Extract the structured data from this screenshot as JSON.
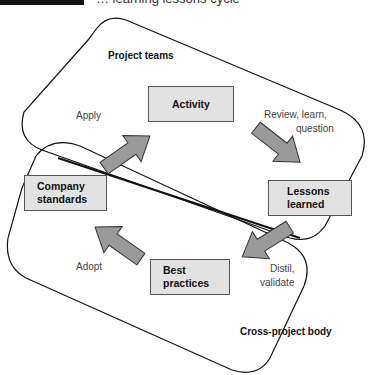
{
  "figure": {
    "caption_partial": "… learning lessons cycle"
  },
  "regions": {
    "top": {
      "title": "Project teams"
    },
    "bottom": {
      "title": "Cross-project body"
    }
  },
  "boxes": {
    "activity": {
      "label": "Activity"
    },
    "lessons": {
      "line1": "Lessons",
      "line2": "learned"
    },
    "best": {
      "line1": "Best",
      "line2": "practices"
    },
    "company": {
      "line1": "Company",
      "line2": "standards"
    }
  },
  "arrows": {
    "apply": {
      "label": "Apply",
      "from": "Company standards",
      "to": "Activity"
    },
    "review": {
      "line1": "Review, learn,",
      "line2": "question",
      "from": "Activity",
      "to": "Lessons learned"
    },
    "distil": {
      "line1": "Distil,",
      "line2": "validate",
      "from": "Lessons learned",
      "to": "Best practices"
    },
    "adopt": {
      "label": "Adopt",
      "from": "Best practices",
      "to": "Company standards"
    }
  },
  "colors": {
    "box_fill": "#e2e2e2",
    "arrow_fill": "#9a9a9a",
    "outline": "#111111"
  }
}
